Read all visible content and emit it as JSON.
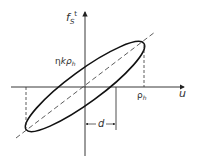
{
  "diagram": {
    "y_axis_label": "f",
    "y_axis_sub": "S",
    "y_axis_sup": "t",
    "x_axis_label": "u",
    "intercept_label_eta": "η",
    "intercept_label_k": "kρ",
    "intercept_label_sub": "h",
    "peak_label": "ρ",
    "peak_label_sub": "h",
    "offset_label": "d"
  }
}
